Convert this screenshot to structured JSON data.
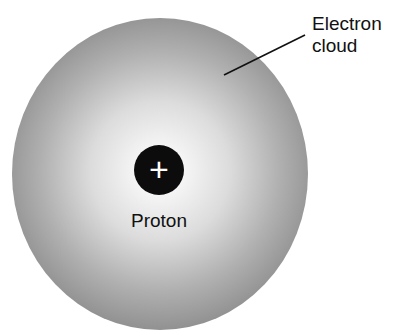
{
  "diagram": {
    "nucleus": {
      "symbol": "+",
      "label": "Proton",
      "color": "#0c0c0c"
    },
    "cloud": {
      "label_line1": "Electron",
      "label_line2": "cloud",
      "color_edge": "#7a7a7a",
      "color_center": "#ffffff"
    }
  }
}
